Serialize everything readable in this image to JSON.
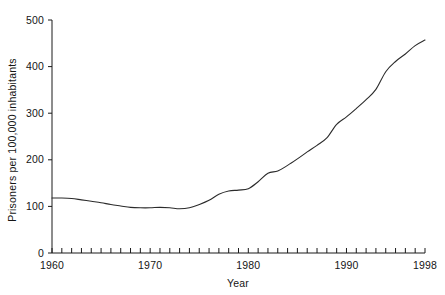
{
  "chart_data": {
    "type": "line",
    "title": "",
    "subtitle": "",
    "xlabel": "Year",
    "ylabel": "Prisoners per 100,000 inhabitants",
    "xlim": [
      1960,
      1998
    ],
    "ylim": [
      0,
      500
    ],
    "grid": false,
    "legend": null,
    "y_ticks": [
      0,
      100,
      200,
      300,
      400,
      500
    ],
    "y_tick_labels": [
      "0",
      "100",
      "200",
      "300",
      "400",
      "500"
    ],
    "x_tick_step": 1,
    "x_labeled_ticks": [
      1960,
      1970,
      1980,
      1990,
      1998
    ],
    "x_tick_labels": [
      "1960",
      "1970",
      "1980",
      "1990",
      "1998"
    ],
    "line_color": "#2b2b2b",
    "line_width": 1.1,
    "background_color": "#ffffff",
    "axis_color": "#1a1a1a",
    "series": [
      {
        "name": "Prisoners per 100,000 inhabitants",
        "x": [
          1960,
          1961,
          1962,
          1963,
          1964,
          1965,
          1966,
          1967,
          1968,
          1969,
          1970,
          1971,
          1972,
          1973,
          1974,
          1975,
          1976,
          1977,
          1978,
          1979,
          1980,
          1981,
          1982,
          1983,
          1984,
          1985,
          1986,
          1987,
          1988,
          1989,
          1990,
          1991,
          1992,
          1993,
          1994,
          1995,
          1996,
          1997,
          1998
        ],
        "values": [
          118,
          118,
          117,
          114,
          111,
          108,
          104,
          101,
          98,
          97,
          97,
          98,
          97,
          95,
          97,
          104,
          113,
          126,
          133,
          135,
          138,
          153,
          171,
          176,
          188,
          202,
          217,
          231,
          247,
          276,
          292,
          310,
          329,
          351,
          389,
          411,
          427,
          445,
          457
        ]
      }
    ]
  },
  "axis_labels": {
    "x_title": "Year",
    "y_title": "Prisoners per 100,000 inhabitants"
  }
}
